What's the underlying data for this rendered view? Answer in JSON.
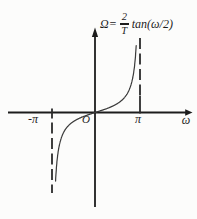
{
  "figure": {
    "formula": {
      "lhs": "Ω=",
      "numerator": "2",
      "denominator": "T",
      "rhs": "tan(ω/2)",
      "full": "Ω = (2/T)·tan(ω/2)"
    }
  },
  "chart_data": {
    "type": "line",
    "xlabel": "ω",
    "ylabel": "Ω",
    "origin_label": "O",
    "x_ticks": [
      {
        "value_pi": -1,
        "label": "-π"
      },
      {
        "value_pi": 1,
        "label": "π"
      }
    ],
    "asymptotes_pi": [
      -1,
      1
    ],
    "x_range_pi": [
      -0.917,
      0.917
    ],
    "grid": false,
    "legend_position": "none",
    "series": [
      {
        "name": "Ω(ω) = (2/T)·tan(ω/2)",
        "x_pi": [
          -0.91,
          -0.85,
          -0.75,
          -0.6,
          -0.4,
          -0.2,
          0,
          0.2,
          0.4,
          0.6,
          0.75,
          0.85,
          0.91
        ],
        "y_tan_half_omega": [
          -7.03,
          -4.17,
          -2.41,
          -1.38,
          -0.73,
          -0.33,
          0,
          0.33,
          0.73,
          1.38,
          2.41,
          4.17,
          7.03
        ]
      }
    ],
    "colors": {
      "axis": "#1c1c1c",
      "curve": "#3a3a3a",
      "dashed": "#2b2b2b",
      "text": "#1d1d1d",
      "background": "#fcfcfb"
    }
  }
}
